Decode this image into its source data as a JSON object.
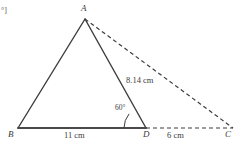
{
  "figure": {
    "type": "geometry-triangle-diagram",
    "corner_fragment": "°]",
    "vertices": [
      {
        "id": "A",
        "label": "A",
        "x": 85,
        "y": 19
      },
      {
        "id": "B",
        "label": "B",
        "x": 18,
        "y": 128
      },
      {
        "id": "D",
        "label": "D",
        "x": 146,
        "y": 128
      },
      {
        "id": "C",
        "label": "C",
        "x": 233,
        "y": 128
      }
    ],
    "segments": [
      {
        "name": "AB",
        "from": "A",
        "to": "B",
        "style": "solid",
        "width": 1.4
      },
      {
        "name": "AD",
        "from": "A",
        "to": "D",
        "style": "solid",
        "width": 1.4
      },
      {
        "name": "BD",
        "from": "B",
        "to": "D",
        "style": "solid",
        "width": 2.0
      },
      {
        "name": "AC",
        "from": "A",
        "to": "C",
        "style": "dashed",
        "width": 1.2
      },
      {
        "name": "DC",
        "from": "D",
        "to": "C",
        "style": "dashed",
        "width": 1.2
      }
    ],
    "measures": {
      "bd_length": "11 cm",
      "dc_length": "6 cm",
      "ad_length": "8.14 cm",
      "angle_adb": "60°"
    },
    "angle_arc": {
      "vertex": "D",
      "radius": 22,
      "start_deg": 180,
      "end_deg": 220
    },
    "colors": {
      "stroke": "#3c3c3c",
      "baseline_stroke": "#4a4a4a",
      "text": "#3c3c3c",
      "background": "#ffffff"
    }
  }
}
